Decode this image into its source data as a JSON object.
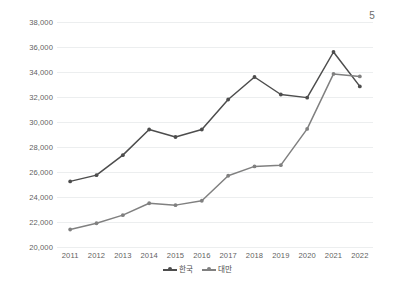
{
  "page": {
    "number": "5"
  },
  "chart_data": {
    "type": "line",
    "title": "",
    "subtitle": "",
    "xlabel": "",
    "ylabel": "",
    "categories": [
      "2011",
      "2012",
      "2013",
      "2014",
      "2015",
      "2016",
      "2017",
      "2018",
      "2019",
      "2020",
      "2021",
      "2022"
    ],
    "x": [
      2011,
      2012,
      2013,
      2014,
      2015,
      2016,
      2017,
      2018,
      2019,
      2020,
      2021,
      2022
    ],
    "ylim": [
      20000,
      38000
    ],
    "ytick_labels": [
      "38,000",
      "36,000",
      "34,000",
      "32,000",
      "30,000",
      "28,000",
      "26,000",
      "24,000",
      "22,000",
      "20,000"
    ],
    "ytick_values": [
      38000,
      36000,
      34000,
      32000,
      30000,
      28000,
      26000,
      24000,
      22000,
      20000
    ],
    "grid": true,
    "legend_position": "bottom",
    "series": [
      {
        "name": "한국",
        "color": "#4d4d4d",
        "values": [
          25250,
          25750,
          27350,
          29400,
          28800,
          29400,
          31800,
          33600,
          32200,
          31950,
          35600,
          32850
        ]
      },
      {
        "name": "대만",
        "color": "#808080",
        "values": [
          21400,
          21900,
          22550,
          23500,
          23350,
          23700,
          25700,
          26450,
          26550,
          29450,
          33850,
          33650
        ]
      }
    ]
  }
}
